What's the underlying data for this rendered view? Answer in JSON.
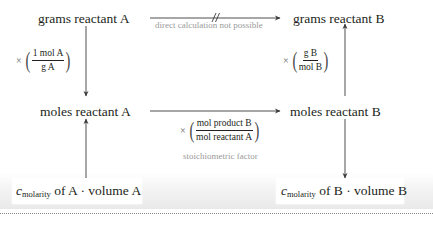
{
  "nodes": {
    "grams_a": "grams reactant A",
    "grams_b": "grams reactant B",
    "moles_a": "moles reactant A",
    "moles_b": "moles reactant B",
    "molarity_a": {
      "symbol": "c",
      "subscript": "molarity",
      "rest": " of A · volume A"
    },
    "molarity_b": {
      "symbol": "c",
      "subscript": "molarity",
      "rest": " of B · volume B"
    }
  },
  "arrows": {
    "direct": {
      "note": "direct calculation not possible",
      "strike": "//"
    },
    "grams_a_to_moles_a": {
      "times": "×",
      "numerator": "1 mol A",
      "denominator": "g A"
    },
    "moles_b_to_grams_b": {
      "times": "×",
      "numerator": "g B",
      "denominator": "mol B"
    },
    "moles_a_to_moles_b": {
      "times": "×",
      "numerator": "mol product B",
      "denominator": "mol reactant A",
      "note": "stoichiometric factor"
    }
  },
  "colors": {
    "text": "#231f20",
    "arrow": "#3a3a3a",
    "note": "#9a9a9a",
    "band": "#e9e9e9"
  }
}
